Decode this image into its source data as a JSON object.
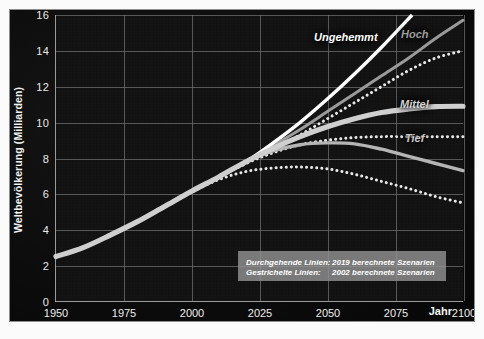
{
  "axes": {
    "ylabel": "Weltbevölkerung (Milliarden)",
    "xlabel": "Jahr",
    "yticks": [
      "0",
      "2",
      "4",
      "6",
      "8",
      "10",
      "12",
      "14",
      "16"
    ],
    "xticks": [
      "1950",
      "1975",
      "2000",
      "2025",
      "2050",
      "2075",
      "2100"
    ]
  },
  "labels": {
    "ungehemmt": "Ungehemmt",
    "hoch": "Hoch",
    "mittel": "Mittel",
    "tief": "Tief"
  },
  "legend": {
    "rows": [
      {
        "key": "Durchgehende Linien:",
        "value": "2019 berechnete Szenarien"
      },
      {
        "key": "Gestrichelte Linien:",
        "value": "2002 berechnete Szenarien"
      }
    ]
  },
  "colors": {
    "background": "#0a0a0a",
    "plot_background": "#101010",
    "grid": "#6f6f6f",
    "axis_text": "#ededed",
    "ungehemmt": "#ffffff",
    "hoch": "#9a9a9a",
    "mittel": "#cfcfcf",
    "tief": "#b5b5b5",
    "dashed": "#e8e8e8",
    "legend_background": "#949494",
    "page": "#fbfbfb"
  },
  "chart_data": {
    "type": "line",
    "title": "",
    "xlabel": "Jahr",
    "ylabel": "Weltbevölkerung (Milliarden)",
    "xlim": [
      1950,
      2100
    ],
    "ylim": [
      0,
      16
    ],
    "grid": true,
    "legend_position": "inside-bottom-right",
    "annotations": [
      "Durchgehende Linien: 2019 berechnete Szenarien",
      "Gestrichelte Linien: 2002 berechnete Szenarien"
    ],
    "x": [
      1950,
      1960,
      1970,
      1980,
      1990,
      2000,
      2010,
      2020,
      2030,
      2040,
      2050,
      2060,
      2070,
      2080,
      2090,
      2100
    ],
    "series": [
      {
        "name": "Ungehemmt",
        "style": "solid",
        "vintage": 2019,
        "color": "#ffffff",
        "values": [
          2.5,
          3.0,
          3.7,
          4.45,
          5.3,
          6.15,
          6.95,
          7.8,
          8.85,
          10.0,
          11.3,
          12.7,
          14.2,
          15.8,
          null,
          null
        ]
      },
      {
        "name": "Hoch",
        "style": "solid",
        "vintage": 2019,
        "color": "#9a9a9a",
        "values": [
          2.5,
          3.0,
          3.7,
          4.45,
          5.3,
          6.15,
          6.95,
          7.8,
          8.7,
          9.6,
          10.6,
          11.6,
          12.6,
          13.6,
          14.7,
          15.7
        ]
      },
      {
        "name": "Mittel",
        "style": "solid",
        "vintage": 2019,
        "color": "#cfcfcf",
        "values": [
          2.5,
          3.0,
          3.7,
          4.45,
          5.3,
          6.15,
          6.95,
          7.8,
          8.55,
          9.2,
          9.75,
          10.2,
          10.55,
          10.75,
          10.88,
          10.9
        ]
      },
      {
        "name": "Tief",
        "style": "solid",
        "vintage": 2019,
        "color": "#b5b5b5",
        "values": [
          2.5,
          3.0,
          3.7,
          4.45,
          5.3,
          6.15,
          6.95,
          7.8,
          8.4,
          8.75,
          8.85,
          8.8,
          8.5,
          8.1,
          7.7,
          7.3
        ]
      },
      {
        "name": "Hoch",
        "style": "dashed",
        "vintage": 2002,
        "color": "#e8e8e8",
        "values": [
          2.5,
          3.0,
          3.7,
          4.45,
          5.3,
          6.15,
          6.95,
          7.7,
          8.5,
          9.3,
          10.2,
          11.1,
          12.0,
          12.9,
          13.6,
          14.0
        ]
      },
      {
        "name": "Mittel",
        "style": "dashed",
        "vintage": 2002,
        "color": "#e8e8e8",
        "values": [
          2.5,
          3.0,
          3.7,
          4.45,
          5.3,
          6.15,
          6.95,
          7.7,
          8.3,
          8.75,
          9.0,
          9.15,
          9.2,
          9.2,
          9.2,
          9.2
        ]
      },
      {
        "name": "Tief",
        "style": "dashed",
        "vintage": 2002,
        "color": "#e8e8e8",
        "values": [
          2.5,
          3.0,
          3.7,
          4.45,
          5.3,
          6.1,
          6.8,
          7.25,
          7.45,
          7.5,
          7.4,
          7.1,
          6.7,
          6.3,
          5.85,
          5.5
        ]
      }
    ]
  }
}
